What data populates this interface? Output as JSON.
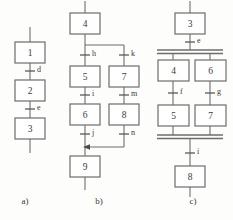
{
  "figure": {
    "type": "sequential-function-chart",
    "background_color": "#fdfdfc",
    "line_color": "#6d6d6d",
    "text_color": "#3a3a3a",
    "captions": [
      {
        "key": "a",
        "label": "a)",
        "x": 25,
        "y": 202
      },
      {
        "key": "b",
        "label": "b)",
        "x": 99,
        "y": 202
      },
      {
        "key": "c",
        "label": "c)",
        "x": 193,
        "y": 202
      }
    ]
  },
  "panel_a": {
    "caption": "a)",
    "description": "linear sequence",
    "steps": [
      {
        "id": "a-step-1",
        "label": "1",
        "x": 15,
        "y": 42,
        "w": 30,
        "h": 21
      },
      {
        "id": "a-step-2",
        "label": "2",
        "x": 15,
        "y": 80,
        "w": 30,
        "h": 21
      },
      {
        "id": "a-step-3",
        "label": "3",
        "x": 15,
        "y": 118,
        "w": 30,
        "h": 21
      }
    ],
    "transitions": [
      {
        "id": "a-trans-d",
        "label": "d",
        "x": 30,
        "y": 71
      },
      {
        "id": "a-trans-e",
        "label": "e",
        "x": 30,
        "y": 109
      }
    ]
  },
  "panel_b": {
    "caption": "b)",
    "description": "alternative (selective) branching",
    "steps": [
      {
        "id": "b-step-4",
        "label": "4",
        "x": 70,
        "y": 13,
        "w": 30,
        "h": 21
      },
      {
        "id": "b-step-5",
        "label": "5",
        "x": 70,
        "y": 66,
        "w": 30,
        "h": 21
      },
      {
        "id": "b-step-7",
        "label": "7",
        "x": 109,
        "y": 66,
        "w": 30,
        "h": 21
      },
      {
        "id": "b-step-6",
        "label": "6",
        "x": 70,
        "y": 104,
        "w": 30,
        "h": 21
      },
      {
        "id": "b-step-8",
        "label": "8",
        "x": 109,
        "y": 104,
        "w": 30,
        "h": 21
      },
      {
        "id": "b-step-9",
        "label": "9",
        "x": 70,
        "y": 156,
        "w": 30,
        "h": 21
      }
    ],
    "transitions": [
      {
        "id": "b-trans-h",
        "label": "h",
        "x": 85,
        "y": 55
      },
      {
        "id": "b-trans-k",
        "label": "k",
        "x": 124,
        "y": 55
      },
      {
        "id": "b-trans-i",
        "label": "i",
        "x": 85,
        "y": 95
      },
      {
        "id": "b-trans-m",
        "label": "m",
        "x": 124,
        "y": 95
      },
      {
        "id": "b-trans-j",
        "label": "j",
        "x": 85,
        "y": 134
      },
      {
        "id": "b-trans-n",
        "label": "n",
        "x": 124,
        "y": 134
      }
    ],
    "branch_divergence_y": 45,
    "branch_convergence_y": 147,
    "arrow_direction": "left"
  },
  "panel_c": {
    "caption": "c)",
    "description": "parallel (simultaneous) branching",
    "steps": [
      {
        "id": "c-step-3",
        "label": "3",
        "x": 175,
        "y": 13,
        "w": 30,
        "h": 21
      },
      {
        "id": "c-step-4",
        "label": "4",
        "x": 158,
        "y": 60,
        "w": 31,
        "h": 21
      },
      {
        "id": "c-step-6",
        "label": "6",
        "x": 195,
        "y": 60,
        "w": 31,
        "h": 21
      },
      {
        "id": "c-step-5",
        "label": "5",
        "x": 158,
        "y": 105,
        "w": 31,
        "h": 21
      },
      {
        "id": "c-step-7",
        "label": "7",
        "x": 195,
        "y": 105,
        "w": 31,
        "h": 21
      },
      {
        "id": "c-step-8",
        "label": "8",
        "x": 175,
        "y": 166,
        "w": 30,
        "h": 21
      }
    ],
    "transitions": [
      {
        "id": "c-trans-e",
        "label": "e",
        "x": 190,
        "y": 42
      },
      {
        "id": "c-trans-f",
        "label": "f",
        "x": 173,
        "y": 93
      },
      {
        "id": "c-trans-g",
        "label": "g",
        "x": 210,
        "y": 93
      },
      {
        "id": "c-trans-i",
        "label": "i",
        "x": 190,
        "y": 153
      }
    ],
    "parallel_bars": [
      {
        "id": "c-par-bar-top",
        "x1": 157,
        "x2": 223,
        "y1": 50,
        "y2": 53.5
      },
      {
        "id": "c-par-bar-bottom",
        "x1": 157,
        "x2": 223,
        "y1": 135,
        "y2": 138.5
      }
    ]
  }
}
